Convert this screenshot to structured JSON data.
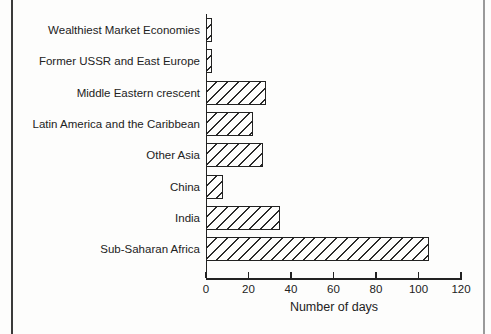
{
  "chart_data": {
    "type": "bar",
    "orientation": "horizontal",
    "title": "",
    "xlabel": "Number of days",
    "ylabel": "",
    "categories": [
      "Wealthiest Market Economies",
      "Former USSR and East Europe",
      "Middle Eastern crescent",
      "Latin America and the Caribbean",
      "Other Asia",
      "China",
      "India",
      "Sub-Saharan Africa"
    ],
    "values": [
      3,
      3,
      28,
      22,
      27,
      8,
      35,
      105
    ],
    "x_ticks": [
      0,
      20,
      40,
      60,
      80,
      100,
      120
    ],
    "xlim": [
      0,
      120
    ],
    "grid": false,
    "legend": false,
    "bar_style": "diagonal-hatch",
    "colors": {
      "ink": "#222222",
      "background": "#fdfdfc",
      "hatch": "#2a2a2a",
      "frame_left_line": "#3a3a3a",
      "frame_right_line": "#9a9a9a"
    }
  }
}
